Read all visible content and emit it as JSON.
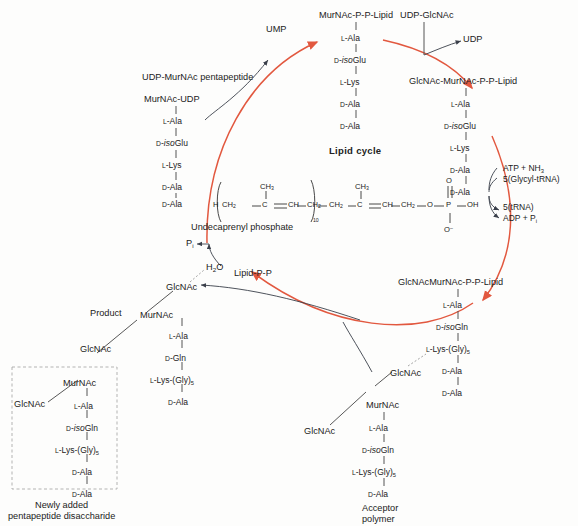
{
  "figure": {
    "title": "Lipid cycle",
    "caption_newly_added": [
      "Newly added",
      "pentapeptide disaccharide"
    ],
    "caption_acceptor": [
      "Acceptor",
      "polymer"
    ],
    "caption_product": "Product",
    "caption_undecaprenyl": "Undecaprenyl phosphate",
    "accent_color": "#e2583f",
    "line_color": "#3a3f4a"
  },
  "residues": {
    "l_ala": "L-Ala",
    "d_isoglu": "D-isoGlu",
    "l_lys": "L-Lys",
    "d_ala": "D-Ala",
    "d_isogln": "D-isoGln",
    "d_gln": "D-Gln",
    "l_lys_gly5": "L-Lys-(Gly)5"
  },
  "nodes": {
    "ump": "UMP",
    "udp": "UDP",
    "udp_glcnac": "UDP-GlcNAc",
    "udp_murnac_pentapeptide": "UDP-MurNAc pentapeptide",
    "murnac_udp": "MurNAc-UDP",
    "murnac_pp_lipid": "MurNAc-P-P-Lipid",
    "glcnac_murnac_pp_lipid": "GlcNAc-MurNAc-P-P-Lipid",
    "glcnacmurnac_pp_lipid": "GlcNAcMurNAc-P-P-Lipid",
    "lipid_pp": "Lipid-P-P",
    "h2o": "H2O",
    "pi": "Pi",
    "glcnac": "GlcNAc",
    "murnac": "MurNAc"
  },
  "reactions": {
    "in_line1": "ATP + NH3",
    "in_line2": "5(Glycyl-tRNA)",
    "out_line1": "5(tRNA)",
    "out_line2": "ADP + Pi"
  },
  "undecaprenyl": {
    "h": "H",
    "ch2_a": "CH2",
    "c_a": "C",
    "dbl_a": "CH",
    "ch2_b": "CH2",
    "subscript_n": "10",
    "ch3_a": "CH3",
    "ch2_c": "CH2",
    "c_b": "C",
    "dbl_b": "CH",
    "ch2_d": "CH2",
    "ch3_b": "CH3",
    "o_link": "O",
    "p": "P",
    "o_double": "O",
    "oh": "OH",
    "o_minus": "O-"
  },
  "chains": {
    "murnac_pp_lipid_peptide": [
      "L-Ala",
      "D-isoGlu",
      "L-Lys",
      "D-Ala",
      "D-Ala"
    ],
    "glcnac_murnac_pp_lipid_peptide": [
      "L-Ala",
      "D-isoGlu",
      "L-Lys",
      "D-Ala",
      "D-Ala"
    ],
    "glcnacmurnac_pp_lipid_peptide": [
      "L-Ala",
      "D-isoGln",
      "L-Lys-(Gly)5",
      "D-Ala",
      "D-Ala"
    ],
    "acceptor_peptide": [
      "L-Ala",
      "D-isoGln",
      "L-Lys-(Gly)5",
      "D-Ala"
    ],
    "product_upper_peptide": [
      "L-Ala",
      "D-Gln",
      "L-Lys-(Gly)5",
      "D-Ala"
    ],
    "product_lower_peptide": [
      "L-Ala",
      "D-isoGln",
      "L-Lys-(Gly)5",
      "D-Ala",
      "D-Ala"
    ]
  }
}
